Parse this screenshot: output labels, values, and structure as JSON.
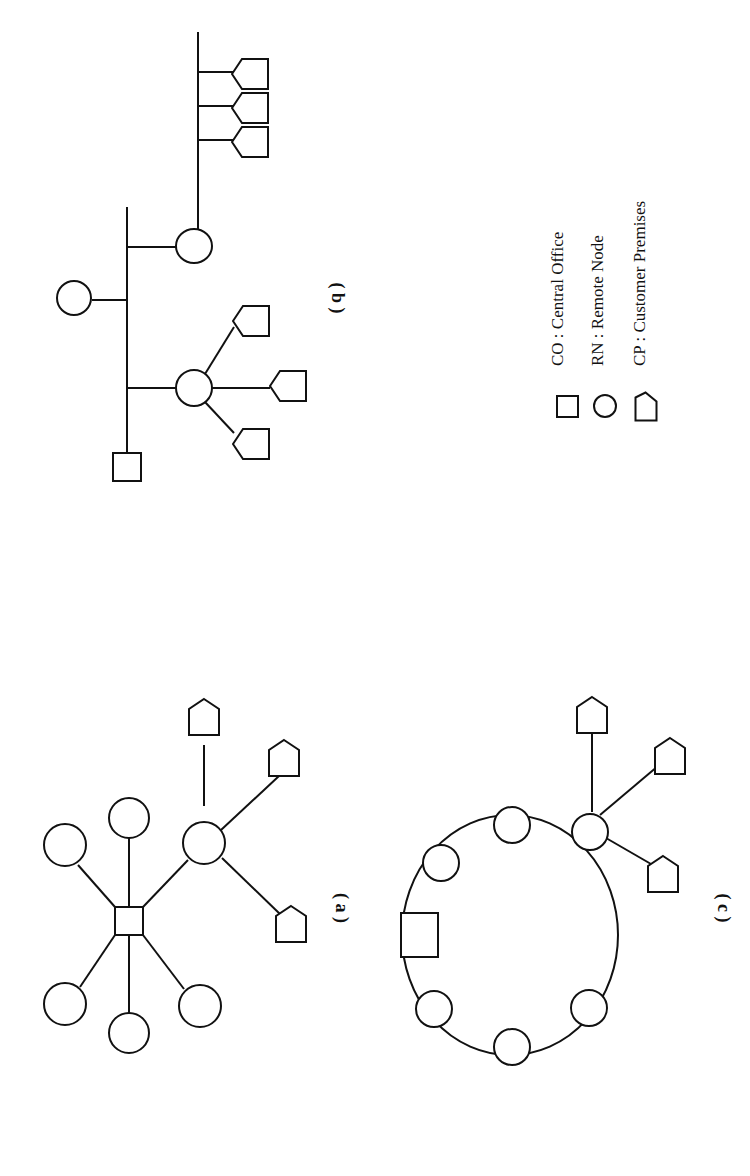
{
  "figure": {
    "orientation": "rotated 90 degrees clockwise",
    "panels": [
      {
        "id": "a",
        "label": "( a )",
        "topology": "star",
        "description": "Central Office connected to five Remote Nodes plus one Remote Node serving three Customer Premises"
      },
      {
        "id": "b",
        "label": "( b )",
        "topology": "bus/tree",
        "description": "Central Office on a bus with three Remote Nodes; one RN fans out to three CPs, another feeds a secondary bus with three CPs"
      },
      {
        "id": "c",
        "label": "( c )",
        "topology": "ring",
        "description": "Central Office on a ring with six Remote Nodes; one RN serves three Customer Premises"
      }
    ],
    "legend": [
      {
        "symbol": "square-icon",
        "abbr": "CO",
        "sep": ":",
        "text": "Central Office"
      },
      {
        "symbol": "circle-icon",
        "abbr": "RN",
        "sep": ":",
        "text": "Remote Node"
      },
      {
        "symbol": "pentagon-icon",
        "abbr": "CP",
        "sep": ":",
        "text": "Customer Premises"
      }
    ]
  },
  "labels": {
    "a": "( a )",
    "b": "( b )",
    "c": "( c )"
  },
  "legend_lines": {
    "co": "CO :  Central Office",
    "rn": "RN :  Remote Node",
    "cp": "CP :  Customer Premises"
  }
}
